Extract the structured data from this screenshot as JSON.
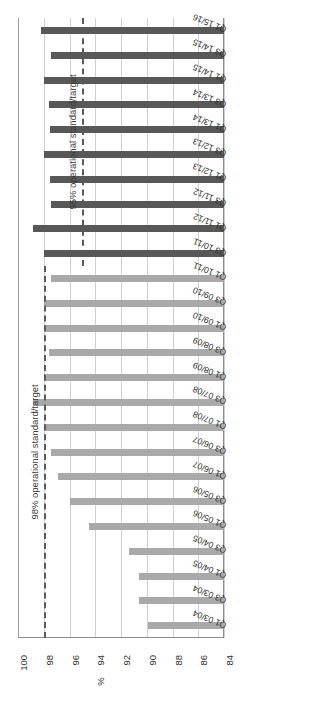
{
  "chart_data": {
    "type": "bar",
    "orientation": "horizontal-rotated",
    "title": "",
    "xlabel": "%",
    "ylabel": "",
    "axis_ticks": [
      100,
      98,
      96,
      94,
      92,
      90,
      88,
      86,
      84
    ],
    "xlim": [
      84,
      100
    ],
    "grid": true,
    "legend": "none",
    "baseline": 84,
    "categories": [
      "Q1 03/04",
      "Q3 03/04",
      "Q1 04/05",
      "Q3 04/05",
      "Q1 05/06",
      "Q3 05/06",
      "Q1 06/07",
      "Q3 06/07",
      "Q1 07/08",
      "Q3 07/08",
      "Q1 08/09",
      "Q3 08/09",
      "Q1 09/10",
      "Q3 09/10",
      "Q1 10/11",
      "Q3 10/11",
      "Q1 11/12",
      "Q3 11/12",
      "Q1 12/13",
      "Q3 12/13",
      "Q1 13/14",
      "Q3 13/14",
      "Q1 14/15",
      "Q3 14/15",
      "Q1 15/16"
    ],
    "values": [
      89.9,
      90.6,
      90.6,
      91.4,
      94.5,
      96.0,
      96.9,
      97.4,
      98.0,
      98.8,
      98.0,
      97.6,
      98.0,
      98.0,
      97.4,
      98.0,
      98.8,
      97.4,
      97.5,
      98.0,
      97.5,
      97.6,
      98.0,
      97.4,
      98.2
    ],
    "series_groups": [
      {
        "name": "98% operational standard/target era",
        "color": "#a9a9a9",
        "from_category": "Q1 03/04",
        "to_category": "Q1 10/11"
      },
      {
        "name": "95% operational standard/target era",
        "color": "#585858",
        "from_category": "Q3 10/11",
        "to_category": "Q1 15/16"
      }
    ],
    "bars": [
      {
        "category": "Q1 03/04",
        "value": 89.9,
        "group": "light"
      },
      {
        "category": "Q3 03/04",
        "value": 90.6,
        "group": "light"
      },
      {
        "category": "Q1 04/05",
        "value": 90.6,
        "group": "light"
      },
      {
        "category": "Q3 04/05",
        "value": 91.4,
        "group": "light"
      },
      {
        "category": "Q1 05/06",
        "value": 94.5,
        "group": "light"
      },
      {
        "category": "Q3 05/06",
        "value": 96.0,
        "group": "light"
      },
      {
        "category": "Q1 06/07",
        "value": 96.9,
        "group": "light"
      },
      {
        "category": "Q3 06/07",
        "value": 97.4,
        "group": "light"
      },
      {
        "category": "Q1 07/08",
        "value": 98.0,
        "group": "light"
      },
      {
        "category": "Q3 07/08",
        "value": 98.8,
        "group": "light"
      },
      {
        "category": "Q1 08/09",
        "value": 98.0,
        "group": "light"
      },
      {
        "category": "Q3 08/09",
        "value": 97.6,
        "group": "light"
      },
      {
        "category": "Q1 09/10",
        "value": 98.0,
        "group": "light"
      },
      {
        "category": "Q3 09/10",
        "value": 98.0,
        "group": "light"
      },
      {
        "category": "Q1 10/11",
        "value": 97.4,
        "group": "light"
      },
      {
        "category": "Q3 10/11",
        "value": 98.0,
        "group": "dark"
      },
      {
        "category": "Q1 11/12",
        "value": 98.8,
        "group": "dark"
      },
      {
        "category": "Q3 11/12",
        "value": 97.4,
        "group": "dark"
      },
      {
        "category": "Q1 12/13",
        "value": 97.5,
        "group": "dark"
      },
      {
        "category": "Q3 12/13",
        "value": 98.0,
        "group": "dark"
      },
      {
        "category": "Q1 13/14",
        "value": 97.5,
        "group": "dark"
      },
      {
        "category": "Q3 13/14",
        "value": 97.6,
        "group": "dark"
      },
      {
        "category": "Q1 14/15",
        "value": 98.0,
        "group": "dark"
      },
      {
        "category": "Q3 14/15",
        "value": 97.4,
        "group": "dark"
      },
      {
        "category": "Q1 15/16",
        "value": 98.2,
        "group": "dark"
      }
    ],
    "reference_lines": [
      {
        "label": "98% operational standard/target",
        "value": 98,
        "style": "dashed",
        "color": "#5a5a5a",
        "spans_categories": [
          "Q1 03/04",
          "Q1 10/11"
        ]
      },
      {
        "label": "95% operational standard/target",
        "value": 95,
        "style": "dashed",
        "color": "#5a5a5a",
        "spans_categories": [
          "Q3 10/11",
          "Q1 15/16"
        ]
      }
    ]
  },
  "colors": {
    "bar_light": "#a9a9a9",
    "bar_dark": "#585858",
    "gridline": "#d0d0d0",
    "axis": "#8c8c8c",
    "text": "#2f2f2f",
    "background": "#ffffff"
  }
}
